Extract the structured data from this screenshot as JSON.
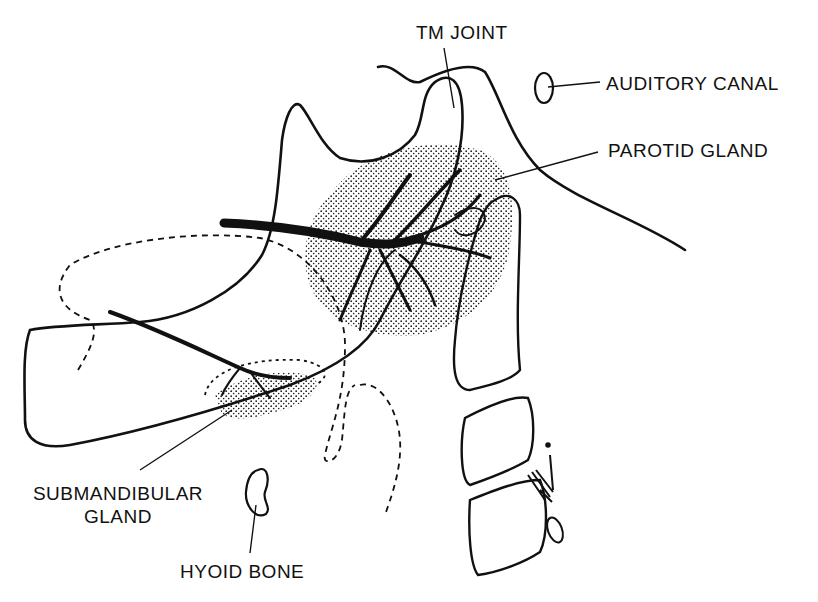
{
  "diagram": {
    "type": "anatomical-line-drawing",
    "labels": {
      "tm_joint": "TM JOINT",
      "auditory_canal": "AUDITORY CANAL",
      "parotid_gland": "PAROTID GLAND",
      "submandibular_line1": "SUBMANDIBULAR",
      "submandibular_line2": "GLAND",
      "hyoid_bone": "HYOID BONE"
    },
    "colors": {
      "ink": "#111111",
      "background": "#ffffff",
      "stipple": "#222222"
    }
  }
}
